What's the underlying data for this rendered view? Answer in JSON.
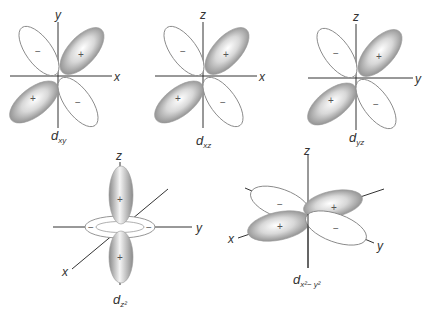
{
  "diagram": {
    "orbitals": [
      {
        "id": "dxy",
        "label_main": "d",
        "label_sub": "xy",
        "axes": {
          "horizontal": "x",
          "vertical": "y"
        },
        "lobes": [
          {
            "position": "upper-left",
            "sign": "−",
            "shaded": false
          },
          {
            "position": "upper-right",
            "sign": "+",
            "shaded": true
          },
          {
            "position": "lower-left",
            "sign": "+",
            "shaded": true
          },
          {
            "position": "lower-right",
            "sign": "−",
            "shaded": false
          }
        ]
      },
      {
        "id": "dxz",
        "label_main": "d",
        "label_sub": "xz",
        "axes": {
          "horizontal": "x",
          "vertical": "z"
        },
        "lobes": [
          {
            "position": "upper-left",
            "sign": "−",
            "shaded": false
          },
          {
            "position": "upper-right",
            "sign": "+",
            "shaded": true
          },
          {
            "position": "lower-left",
            "sign": "+",
            "shaded": true
          },
          {
            "position": "lower-right",
            "sign": "−",
            "shaded": false
          }
        ]
      },
      {
        "id": "dyz",
        "label_main": "d",
        "label_sub": "yz",
        "axes": {
          "horizontal": "y",
          "vertical": "z"
        },
        "lobes": [
          {
            "position": "upper-left",
            "sign": "−",
            "shaded": false
          },
          {
            "position": "upper-right",
            "sign": "+",
            "shaded": true
          },
          {
            "position": "lower-left",
            "sign": "+",
            "shaded": true
          },
          {
            "position": "lower-right",
            "sign": "−",
            "shaded": false
          }
        ]
      },
      {
        "id": "dz2",
        "label_main": "d",
        "label_sub": "z²",
        "axes": {
          "vertical": "z",
          "horizontal": "y",
          "diagonal": "x"
        },
        "lobes": [
          {
            "position": "top",
            "sign": "+",
            "shaded": true
          },
          {
            "position": "bottom",
            "sign": "+",
            "shaded": true
          },
          {
            "position": "torus-left",
            "sign": "−",
            "shaded": false
          },
          {
            "position": "torus-right",
            "sign": "−",
            "shaded": false
          }
        ]
      },
      {
        "id": "dx2y2",
        "label_main": "d",
        "label_sub": "x²− y²",
        "axes": {
          "vertical": "z",
          "diagonal_x": "x",
          "diagonal_y": "y"
        },
        "lobes": [
          {
            "position": "back-left",
            "sign": "−",
            "shaded": false
          },
          {
            "position": "back-right",
            "sign": "+",
            "shaded": true
          },
          {
            "position": "front-left",
            "sign": "+",
            "shaded": true
          },
          {
            "position": "front-right",
            "sign": "−",
            "shaded": false
          }
        ]
      }
    ],
    "colors": {
      "positive_lobe_dark": "#7a7a7a",
      "positive_lobe_light": "#f2f2f2",
      "negative_lobe_fill": "#ffffff",
      "outline": "#8a8a8a",
      "axis": "#333333"
    }
  }
}
